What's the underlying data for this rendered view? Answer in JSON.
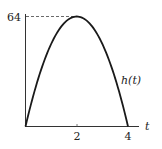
{
  "chart_data": {
    "type": "line",
    "title": "",
    "xlabel": "t",
    "ylabel": "",
    "series": [
      {
        "name": "h(t)",
        "x": [
          0,
          0.5,
          1,
          1.5,
          2,
          2.5,
          3,
          3.5,
          4
        ],
        "values": [
          0,
          28,
          48,
          60,
          64,
          60,
          48,
          28,
          0
        ]
      }
    ],
    "xticks": [
      "2",
      "4"
    ],
    "yticks": [
      "64"
    ],
    "xlim": [
      0,
      4.4
    ],
    "ylim": [
      0,
      64
    ],
    "annotations": [
      "dashed line from y-axis to peak at h = 64"
    ],
    "grid": false,
    "legend": "none"
  },
  "labels": {
    "y_tick_64": "64",
    "x_tick_2": "2",
    "x_tick_4": "4",
    "x_axis_label": "t",
    "curve_label": "h(t)"
  }
}
